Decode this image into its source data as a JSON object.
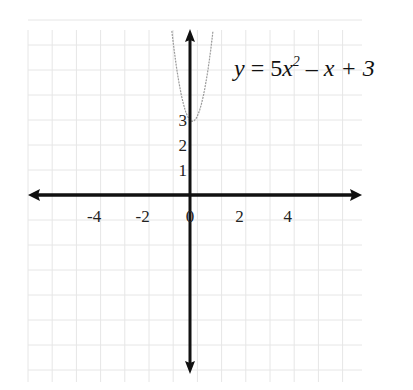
{
  "chart_data": {
    "type": "line",
    "title": "",
    "equation_label": {
      "lhs": "y",
      "eq": " = 5",
      "var": "x",
      "sup": "2",
      "rest": " – x + 3"
    },
    "function": "y = 5x^2 - x + 3",
    "coefficients": {
      "a": 5,
      "b": -1,
      "c": 3
    },
    "xlabel": "",
    "ylabel": "",
    "x_ticks": [
      -4,
      -2,
      0,
      2,
      4
    ],
    "x_tick_labels": [
      "-4",
      "-2",
      "0",
      "2",
      "4"
    ],
    "y_ticks": [
      1,
      2,
      3
    ],
    "y_tick_labels": [
      "1",
      "2",
      "3"
    ],
    "xlim": [
      -6.6,
      7
    ],
    "ylim": [
      -7.1,
      6.5
    ],
    "grid": true,
    "legend": null,
    "series": [
      {
        "name": "5x^2 - x + 3",
        "x": [
          -0.8,
          -0.6,
          -0.4,
          -0.2,
          0,
          0.1,
          0.2,
          0.4,
          0.6,
          0.8
        ],
        "y": [
          7.0,
          5.4,
          4.2,
          3.4,
          3.0,
          2.95,
          3.0,
          3.4,
          4.2,
          5.4
        ]
      }
    ],
    "vertex": {
      "x": 0.1,
      "y": 2.95
    },
    "y_intercept": 3
  },
  "colors": {
    "axis": "#111111",
    "grid": "#e6e6e6",
    "curve": "#9a9a9a",
    "text": "#222222"
  }
}
